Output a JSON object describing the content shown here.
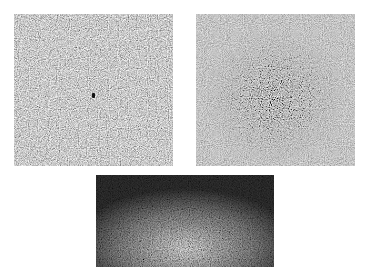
{
  "figure": {
    "panels": [
      {
        "id": "a",
        "description": "uniform gray noise field with small dark point near center",
        "base_color": "#9a9a9a",
        "has_center_marker": true
      },
      {
        "id": "b",
        "description": "gray noise field with a darker, higher-contrast speckle cluster at center",
        "base_color": "#8e8e8e",
        "has_center_marker": false
      },
      {
        "id": "c",
        "description": "dark noise field with brighter speckle in the lower-middle region and darker edges",
        "base_color": "#4a4a4a",
        "has_center_marker": false
      }
    ]
  }
}
